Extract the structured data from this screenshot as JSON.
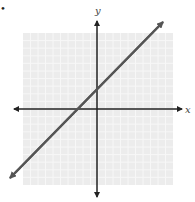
{
  "chart_data": {
    "type": "line",
    "title": "",
    "xlabel": "x",
    "ylabel": "y",
    "xlim": [
      -10,
      10
    ],
    "ylim": [
      -10,
      10
    ],
    "grid": true,
    "legend": null,
    "series": [
      {
        "name": "line",
        "equation": "y = x + 3",
        "slope": 1,
        "y_intercept": 3,
        "x_intercept": -3,
        "x": [
          -10.5,
          10.5
        ],
        "y": [
          -7.5,
          13.5
        ],
        "arrows_both_ends": true
      }
    ]
  },
  "labels": {
    "x_axis": "x",
    "y_axis": "y",
    "marker": "•"
  },
  "colors": {
    "grid_background": "#ececec",
    "grid_lines": "#f7f7f7",
    "axes": "#222222",
    "line": "#555555"
  }
}
